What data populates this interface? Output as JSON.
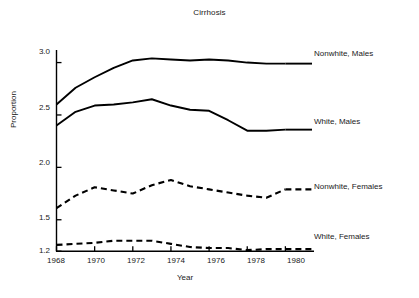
{
  "chart_data": {
    "type": "line",
    "title": "Cirrhosis",
    "xlabel": "Year",
    "ylabel": "Proportion",
    "xlim": [
      1968,
      1981.5
    ],
    "ylim": [
      1.2,
      3.12
    ],
    "grid": false,
    "legend_position": "right-inline-labels",
    "xticks": [
      1968,
      1970,
      1972,
      1974,
      1976,
      1978,
      1980
    ],
    "yticks": [
      1.2,
      1.5,
      2.0,
      2.5,
      3.0
    ],
    "x": [
      1968,
      1969,
      1970,
      1971,
      1972,
      1973,
      1974,
      1975,
      1976,
      1977,
      1978,
      1979,
      1980
    ],
    "series": [
      {
        "name": "Nonwhite, Males",
        "style": "solid",
        "color": "#000000",
        "values": [
          2.6,
          2.76,
          2.86,
          2.95,
          3.02,
          3.04,
          3.03,
          3.02,
          3.03,
          3.02,
          3.0,
          2.99,
          2.99
        ]
      },
      {
        "name": "White, Males",
        "style": "solid",
        "color": "#000000",
        "values": [
          2.4,
          2.53,
          2.59,
          2.6,
          2.62,
          2.65,
          2.59,
          2.55,
          2.54,
          2.45,
          2.35,
          2.35,
          2.36
        ]
      },
      {
        "name": "Nonwhite, Females",
        "style": "dashed",
        "color": "#000000",
        "values": [
          1.61,
          1.73,
          1.81,
          1.78,
          1.75,
          1.83,
          1.88,
          1.82,
          1.79,
          1.76,
          1.73,
          1.71,
          1.79
        ]
      },
      {
        "name": "White, Females",
        "style": "dashed",
        "color": "#000000",
        "values": [
          1.26,
          1.27,
          1.28,
          1.3,
          1.3,
          1.3,
          1.27,
          1.24,
          1.23,
          1.23,
          1.21,
          1.22,
          1.22
        ]
      }
    ]
  },
  "axis": {
    "ytick_labels": [
      "3.0",
      "2.5",
      "2.0",
      "1.5",
      "1.2"
    ],
    "xtick_labels": [
      "1968",
      "1970",
      "1972",
      "1974",
      "1976",
      "1978",
      "1980"
    ]
  },
  "series_labels": [
    {
      "text": "Nonwhite, Males"
    },
    {
      "text": "White, Males"
    },
    {
      "text": "Nonwhite, Females"
    },
    {
      "text": "White, Females"
    }
  ]
}
